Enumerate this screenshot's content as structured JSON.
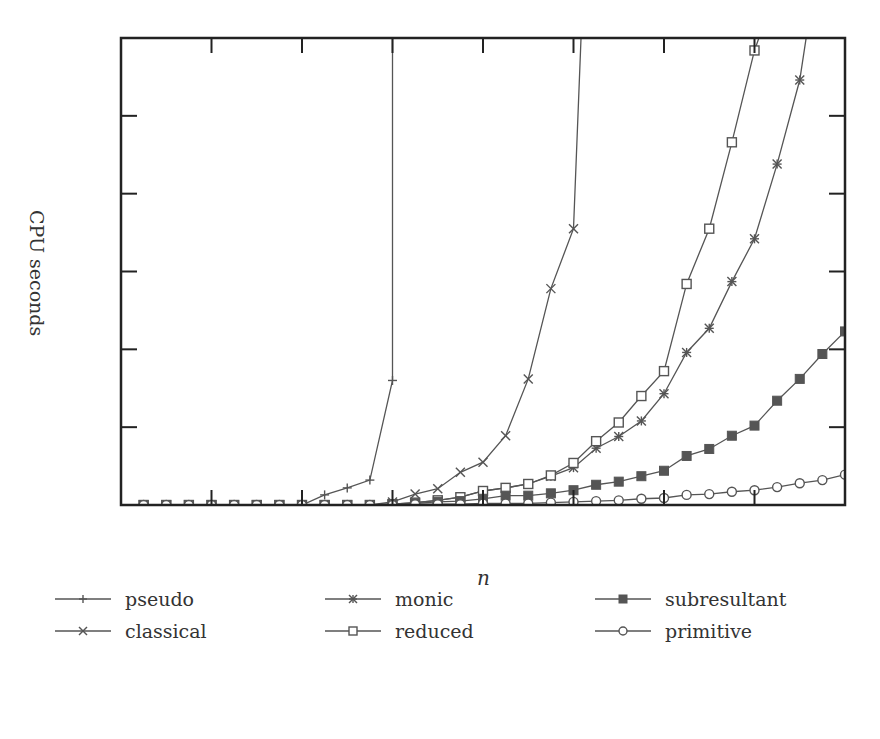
{
  "chart_data": {
    "type": "line",
    "title": "",
    "xlabel": "n",
    "ylabel": "CPU seconds",
    "x_ticks_labeled": false,
    "y_ticks_labeled": false,
    "xlim": [
      0,
      32
    ],
    "ylim": [
      0,
      6
    ],
    "x_tick_positions": [
      0,
      4,
      8,
      12,
      16,
      20,
      24,
      28,
      32
    ],
    "y_tick_positions": [
      0,
      1,
      2,
      3,
      4,
      5,
      6
    ],
    "grid": false,
    "legend_position": "bottom, 3 columns x 2 rows",
    "x": [
      1,
      2,
      3,
      4,
      5,
      6,
      7,
      8,
      9,
      10,
      11,
      12,
      13,
      14,
      15,
      16,
      17,
      18,
      19,
      20,
      21,
      22,
      23,
      24,
      25,
      26,
      27,
      28,
      29,
      30,
      31,
      32
    ],
    "series": [
      {
        "name": "pseudo",
        "marker": "plus",
        "values": [
          0,
          0,
          0,
          0,
          0,
          0,
          0,
          0,
          0.13,
          0.22,
          0.32,
          1.6,
          null,
          null,
          null,
          null,
          null,
          null,
          null,
          null,
          null,
          null,
          null,
          null,
          null,
          null,
          null,
          null,
          null,
          null,
          null,
          null
        ],
        "note": "exceeds plot top after n=12"
      },
      {
        "name": "classical",
        "marker": "x",
        "values": [
          0,
          0,
          0,
          0,
          0,
          0,
          0,
          0,
          0,
          0,
          0,
          0.04,
          0.14,
          0.21,
          0.42,
          0.55,
          0.89,
          1.62,
          2.78,
          3.55,
          null,
          null,
          null,
          null,
          null,
          null,
          null,
          null,
          null,
          null,
          null,
          null
        ],
        "note": "exceeds plot top after n=20"
      },
      {
        "name": "monic",
        "marker": "asterisk",
        "values": [
          0,
          0,
          0,
          0,
          0,
          0,
          0,
          0,
          0,
          0,
          0,
          0.01,
          0.03,
          0.06,
          0.1,
          0.18,
          0.22,
          0.27,
          0.37,
          0.48,
          0.73,
          0.88,
          1.08,
          1.43,
          1.96,
          2.27,
          2.87,
          3.42,
          4.38,
          5.46,
          null,
          null
        ],
        "note": "exceeds plot top after n=30"
      },
      {
        "name": "reduced",
        "marker": "square-open",
        "values": [
          0,
          0,
          0,
          0,
          0,
          0,
          0,
          0,
          0,
          0,
          0,
          0.01,
          0.03,
          0.06,
          0.1,
          0.18,
          0.22,
          0.27,
          0.38,
          0.54,
          0.82,
          1.06,
          1.4,
          1.72,
          2.84,
          3.55,
          4.66,
          5.84,
          null,
          null,
          null,
          null
        ],
        "note": "exceeds plot top after n=28"
      },
      {
        "name": "subresultant",
        "marker": "square-filled",
        "values": [
          0,
          0,
          0,
          0,
          0,
          0,
          0,
          0,
          0,
          0,
          0,
          0.01,
          0.02,
          0.04,
          0.05,
          0.08,
          0.12,
          0.12,
          0.15,
          0.19,
          0.26,
          0.3,
          0.37,
          0.44,
          0.63,
          0.72,
          0.89,
          1.02,
          1.34,
          1.62,
          1.94,
          2.23
        ]
      },
      {
        "name": "primitive",
        "marker": "circle-open",
        "values": [
          0,
          0,
          0,
          0,
          0,
          0,
          0,
          0,
          0,
          0,
          0,
          0,
          0.01,
          0.01,
          0.01,
          0.02,
          0.02,
          0.02,
          0.03,
          0.04,
          0.05,
          0.06,
          0.08,
          0.09,
          0.13,
          0.14,
          0.17,
          0.19,
          0.23,
          0.28,
          0.32,
          0.39
        ]
      }
    ]
  },
  "labels": {
    "ylabel": "CPU seconds",
    "xlabel": "n"
  },
  "legend": [
    {
      "label": "pseudo",
      "marker": "plus"
    },
    {
      "label": "classical",
      "marker": "x"
    },
    {
      "label": "monic",
      "marker": "asterisk"
    },
    {
      "label": "reduced",
      "marker": "square-open"
    },
    {
      "label": "subresultant",
      "marker": "square-filled"
    },
    {
      "label": "primitive",
      "marker": "circle-open"
    }
  ],
  "colors": {
    "frame": "#222222",
    "series_line": "#555555",
    "text": "#333333"
  }
}
